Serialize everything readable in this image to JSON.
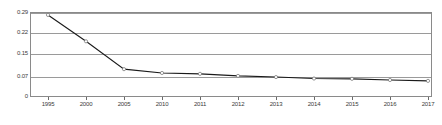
{
  "chart_data": {
    "type": "line",
    "title": "",
    "subtitle": "",
    "xlabel": "",
    "ylabel": "",
    "categories": [
      "1995",
      "2000",
      "2005",
      "2010",
      "2011",
      "2012",
      "2013",
      "2014",
      "2015",
      "2016",
      "2017"
    ],
    "x_tick_labels": [
      "1995",
      "2000",
      "2005",
      "2010",
      "2011",
      "2012",
      "2013",
      "2014",
      "2015",
      "2016",
      "2017"
    ],
    "y_tick_labels": [
      "0.29",
      "0.22",
      "0.15",
      "0.07",
      "0"
    ],
    "y_tick_values": [
      0.29,
      0.22,
      0.15,
      0.07,
      0
    ],
    "values": [
      0.28,
      0.19,
      0.095,
      0.082,
      0.079,
      0.072,
      0.068,
      0.063,
      0.062,
      0.058,
      0.055
    ],
    "series": [
      {
        "name": "",
        "values": [
          0.28,
          0.19,
          0.095,
          0.082,
          0.079,
          0.072,
          0.068,
          0.063,
          0.062,
          0.058,
          0.055
        ]
      }
    ],
    "ylim": [
      0,
      0.29
    ],
    "grid": true,
    "grid_axis": "y",
    "legend": "none",
    "marker": "circle",
    "line_color": "#1a1a1a",
    "grid_color": "#9a9a9a",
    "frame_color": "#8a8a8a",
    "background_color": "#ffffff"
  }
}
